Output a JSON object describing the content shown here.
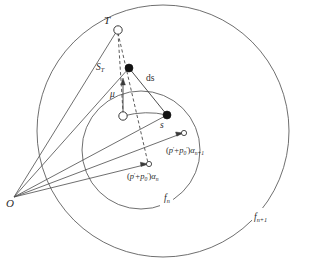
{
  "figure": {
    "kind": "geometric-diagram",
    "background_color": "#ffffff",
    "stroke_color": "#3a3a3a",
    "label_color": "#2b2b2b"
  },
  "labels": {
    "apex_T": "T",
    "origin_O": "O",
    "arc_length_ST_base": "S",
    "arc_length_ST_sub": "T",
    "mu": "μ",
    "ds": "ds",
    "s": "s",
    "f_n_base": "f",
    "f_n_sub": "n",
    "f_np1_base": "f",
    "f_np1_sub": "n+1",
    "alpha_n_formula": "(p′+p₀′)αₙ",
    "alpha_np1_formula": "(p′+p₀′)αₙ₊₁"
  },
  "formula_parts": {
    "open_paren": "(",
    "p_prime": "p",
    "prime": "′",
    "plus": "+",
    "p_zero": "p",
    "zero_sub": "0",
    "close_paren": ")",
    "alpha": "α",
    "n_sub": "n",
    "n_plus_1_sub": "n+1"
  },
  "markers": {
    "T_node": "open-circle",
    "center_node": "open-circle",
    "upper_point": "filled-circle",
    "s_point": "filled-circle",
    "alpha_n_target": "open-circle-small",
    "alpha_np1_target": "open-circle-small"
  },
  "geometry": {
    "outer_circle": {
      "cx": 163,
      "cy": 131,
      "r": 126,
      "name": "f_{n+1}"
    },
    "inner_circle": {
      "cx": 141,
      "cy": 150,
      "r": 59,
      "name": "f_n"
    },
    "apex_T": {
      "x": 118,
      "y": 29
    },
    "origin_O": {
      "x": 14,
      "y": 197
    },
    "center_node": {
      "x": 123,
      "y": 116
    },
    "upper_filled_point": {
      "x": 129,
      "y": 68
    },
    "s_filled_point": {
      "x": 167,
      "y": 115
    },
    "alpha_n_target": {
      "x": 148,
      "y": 164
    },
    "alpha_np1_target": {
      "x": 183,
      "y": 133
    }
  }
}
